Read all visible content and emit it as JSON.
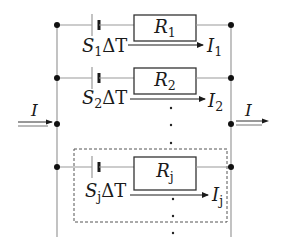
{
  "diagram": {
    "type": "parallel-circuit",
    "input_current": {
      "symbol": "I"
    },
    "output_current": {
      "symbol": "I"
    },
    "branches": [
      {
        "source": {
          "symbol": "S",
          "subscript": "1",
          "suffix": "ΔT"
        },
        "resistor": {
          "symbol": "R",
          "subscript": "1"
        },
        "current": {
          "symbol": "I",
          "subscript": "1"
        }
      },
      {
        "source": {
          "symbol": "S",
          "subscript": "2",
          "suffix": "ΔT"
        },
        "resistor": {
          "symbol": "R",
          "subscript": "2"
        },
        "current": {
          "symbol": "I",
          "subscript": "2"
        }
      },
      {
        "source": {
          "symbol": "S",
          "subscript": "j",
          "suffix": "ΔT"
        },
        "resistor": {
          "symbol": "R",
          "subscript": "j"
        },
        "current": {
          "symbol": "I",
          "subscript": "j"
        },
        "highlighted": true
      }
    ],
    "ellipsis": "⋮",
    "colors": {
      "wire": "#9a9a9a",
      "ink": "#1a1a1a",
      "dashed_box": "#555555"
    }
  }
}
